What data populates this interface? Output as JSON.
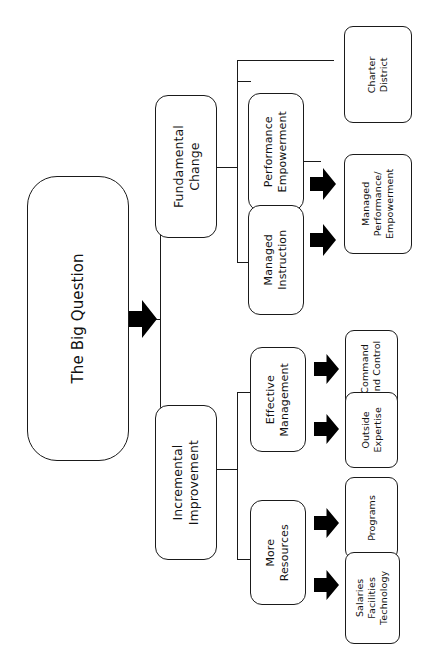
{
  "diagram": {
    "title": "The Big Question",
    "orientation": "rotated-90-vertical-text",
    "root": {
      "label": "The Big Question"
    },
    "branches": {
      "fundamental_change": {
        "label": "Fundamental\nChange"
      },
      "incremental_improvement": {
        "label": "Incremental\nImprovement"
      }
    },
    "strategies": {
      "performance_empowerment": {
        "label": "Performance\nEmpowerment"
      },
      "managed_instruction": {
        "label": "Managed\nInstruction"
      },
      "effective_management": {
        "label": "Effective\nManagement"
      },
      "more_resources": {
        "label": "More\nResources"
      }
    },
    "outcomes": {
      "charter_district": {
        "label": "Charter\nDistrict"
      },
      "managed_performance_empowerment": {
        "label": "Managed\nPerformance/\nEmpowerment"
      },
      "command_and_control": {
        "label": "Command\nand Control"
      },
      "outside_expertise": {
        "label": "Outside\nExpertise"
      },
      "programs": {
        "label": "Programs"
      },
      "salaries_facilities_technology": {
        "label": "Salaries\nFacilities\nTechnology"
      }
    },
    "colors": {
      "stroke": "#1a1a1a",
      "fill": "#ffffff",
      "text": "#111111",
      "arrow": "#000000"
    }
  }
}
